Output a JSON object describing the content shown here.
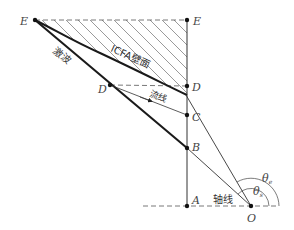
{
  "diagram": {
    "points": {
      "E_left": "E",
      "E_right": "E",
      "D_left": "D",
      "D_right": "D",
      "C": "C",
      "B": "B",
      "A": "A",
      "O": "O"
    },
    "labels": {
      "shock": "激波",
      "wall": "ICFA壁面",
      "streamline": "流线",
      "axis": "轴线",
      "theta_e": "θ",
      "theta_e_sub": "e",
      "theta_s": "θ",
      "theta_s_sub": "s"
    },
    "colors": {
      "line": "#1a1a1a",
      "thin_line": "#333333",
      "hatch": "#555555",
      "dash": "#555555"
    }
  }
}
